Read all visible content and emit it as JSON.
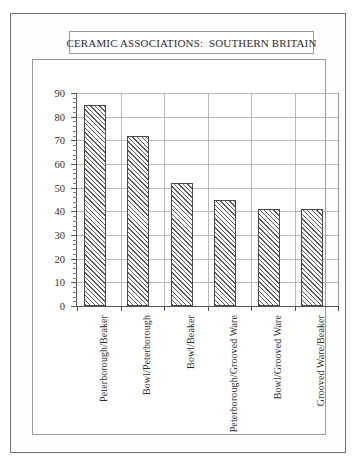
{
  "figure": {
    "title": "CERAMIC ASSOCIATIONS:  SOUTHERN BRITAIN"
  },
  "chart_data": {
    "type": "bar",
    "title": "CERAMIC ASSOCIATIONS:  SOUTHERN BRITAIN",
    "xlabel": "",
    "ylabel": "",
    "ylim": [
      0,
      90
    ],
    "ytick_step": 10,
    "minor_ticks": true,
    "grid": "horizontal-and-vertical",
    "legend": "none",
    "categories": [
      "Peterborough/Beaker",
      "Bowl/Peterborough",
      "Bowl/Beaker",
      "Peterborough/Grooved Ware",
      "Bowl/Grooved Ware",
      "Grooved Ware/Beaker"
    ],
    "values": [
      85,
      72,
      52,
      45,
      41,
      41
    ],
    "ytick_labels": [
      "0",
      "10",
      "20",
      "30",
      "40",
      "50",
      "60",
      "70",
      "80",
      "90"
    ],
    "bar_style": "diagonal-hatch",
    "bar_edge_color": "#4a4a4a",
    "bar_fill_color": "#ffffff"
  },
  "colors": {
    "frame": "#6f6f6f",
    "panel_border": "#9a9a9a",
    "axis": "#555555",
    "gridline": "#b9b9b9",
    "text": "#2e2e2e",
    "background": "#ffffff"
  }
}
